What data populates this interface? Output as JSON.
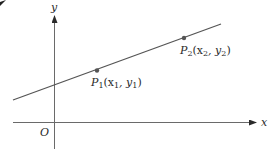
{
  "diagram": {
    "title": "",
    "axes": {
      "x_label": "x",
      "y_label": "y",
      "origin_label": "O"
    },
    "points": [
      {
        "name": "P1",
        "label_main": "P",
        "label_sub": "1",
        "label_coords": "(x",
        "x_sub": "1",
        "sep": ", y",
        "y_sub": "1",
        "close": ")"
      },
      {
        "name": "P2",
        "label_main": "P",
        "label_sub": "2",
        "label_coords": "(x",
        "x_sub": "2",
        "sep": ", y",
        "y_sub": "2",
        "close": ")"
      }
    ],
    "colors": {
      "axis": "#6a6a6a",
      "line": "#555555",
      "text": "#2a2a2a",
      "background": "#ffffff"
    }
  }
}
